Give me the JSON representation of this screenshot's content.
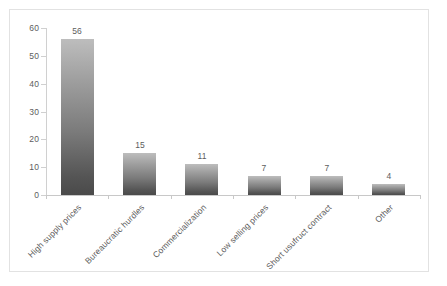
{
  "chart_data": {
    "type": "bar",
    "title": "",
    "subtitle": "",
    "xlabel": "",
    "ylabel": "",
    "ylim": [
      0,
      60
    ],
    "ytick_labels": [
      "0",
      "10",
      "20",
      "30",
      "40",
      "50",
      "60"
    ],
    "ytick_values": [
      0,
      10,
      20,
      30,
      40,
      50,
      60
    ],
    "grid": false,
    "legend": false,
    "legend_position": "none",
    "categories": [
      "High supply prices",
      "Bureaucratic hurdles",
      "Commercialization",
      "Low selling prices",
      "Short usufruct contract",
      "Other"
    ],
    "values": [
      56,
      15,
      11,
      7,
      7,
      4
    ],
    "value_labels": [
      "56",
      "15",
      "11",
      "7",
      "7",
      "4"
    ],
    "bar_color_top": "#bdbdbd",
    "bar_color_bottom": "#4a4a4a",
    "axis_color": "#c8c8c8",
    "text_color": "#5d5d5d",
    "frame_color": "#e2e2e2",
    "background_color": "#ffffff"
  }
}
